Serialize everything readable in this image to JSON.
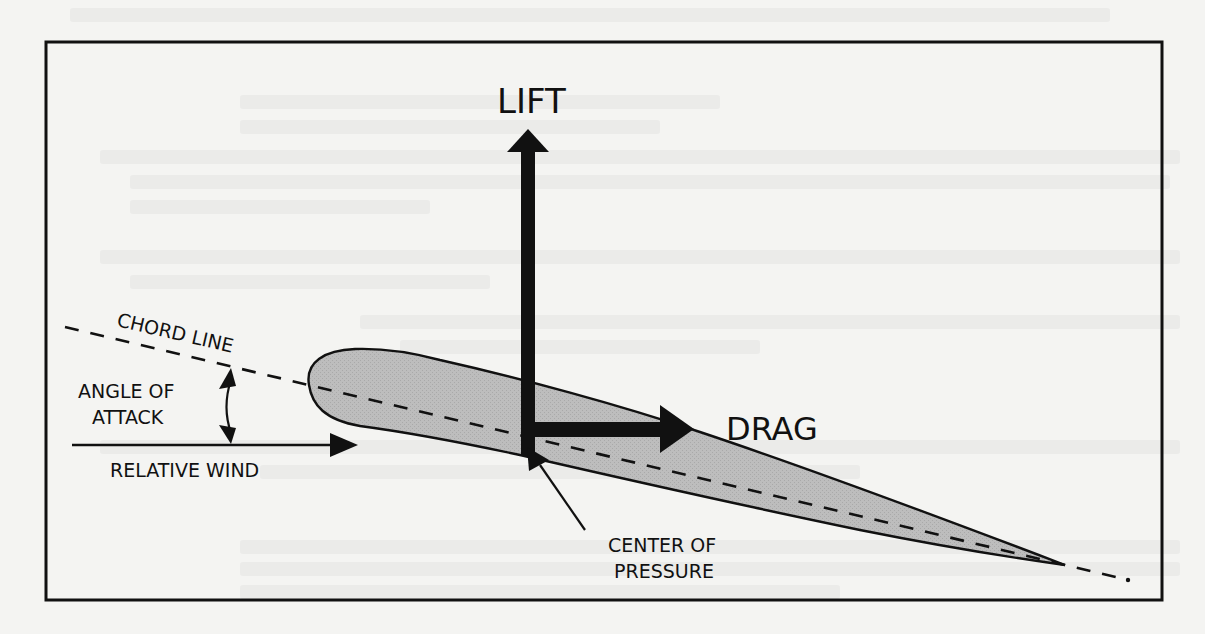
{
  "figure": {
    "labels": {
      "lift": "LIFT",
      "drag": "DRAG",
      "chord_line": "CHORD LINE",
      "angle_of_attack_line1": "ANGLE OF",
      "angle_of_attack_line2": "ATTACK",
      "relative_wind": "RELATIVE WIND",
      "center_of_pressure_line1": "CENTER OF",
      "center_of_pressure_line2": "PRESSURE"
    },
    "elements": [
      {
        "name": "frame",
        "type": "rectangle"
      },
      {
        "name": "airfoil",
        "type": "shape",
        "fill": "#bdbdbd"
      },
      {
        "name": "chord-line",
        "type": "dashed-line"
      },
      {
        "name": "lift-arrow",
        "type": "arrow",
        "direction": "up"
      },
      {
        "name": "drag-arrow",
        "type": "arrow",
        "direction": "right"
      },
      {
        "name": "relative-wind-arrow",
        "type": "arrow",
        "direction": "right"
      },
      {
        "name": "angle-of-attack-arrow",
        "type": "double-arrow",
        "direction": "vertical"
      },
      {
        "name": "center-of-pressure-pointer",
        "type": "arrow",
        "direction": "up-left"
      }
    ],
    "colors": {
      "ink": "#111111",
      "airfoil_fill": "#bdbdbd",
      "paper": "#f4f4f2"
    }
  }
}
